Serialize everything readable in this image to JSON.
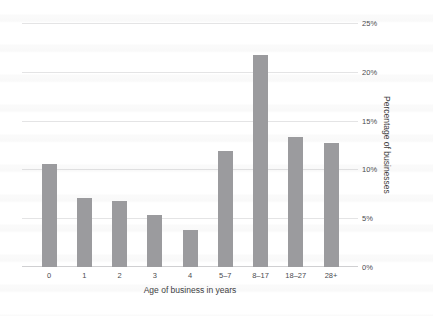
{
  "chart_data": {
    "type": "bar",
    "title": "",
    "xlabel": "Age of business in years",
    "ylabel": "Percentage of businesses",
    "categories": [
      "0",
      "1",
      "2",
      "3",
      "4",
      "5–7",
      "8–17",
      "18–27",
      "28+"
    ],
    "values": [
      10.6,
      7.1,
      6.8,
      5.4,
      3.8,
      11.9,
      21.8,
      13.4,
      12.8
    ],
    "ytick_labels": [
      "0%",
      "5%",
      "10%",
      "15%",
      "20%",
      "25%"
    ],
    "ytick_values": [
      0,
      5,
      10,
      15,
      20,
      25
    ],
    "ylim": [
      0,
      25
    ],
    "grid": true,
    "legend": "none",
    "bar_color": "#9b9b9e",
    "grid_color": "#b8b8bd",
    "text_color": "#4b4b4f"
  }
}
